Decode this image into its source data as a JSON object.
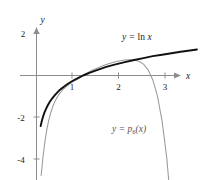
{
  "chart_data": {
    "type": "line",
    "title": "",
    "xlabel": "x",
    "ylabel": "y",
    "xlim": [
      -0.35,
      3.45
    ],
    "ylim": [
      -4.9,
      2.45
    ],
    "grid": false,
    "legend_position": "inline-annotations",
    "xticks": [
      1,
      2,
      3
    ],
    "xtick_labels": [
      "1",
      "2",
      "3"
    ],
    "yticks": [
      2,
      -2,
      -4
    ],
    "ytick_labels": [
      "2",
      "-2",
      "-4"
    ],
    "series": [
      {
        "name": "y = ln x",
        "label_plain": "y = ln x",
        "label_lhs": "y",
        "label_eq": "=",
        "label_fn": "ln",
        "label_arg": "x",
        "color": "#111111",
        "width": 1.9,
        "x": [
          0.09,
          0.1,
          0.12,
          0.14,
          0.17,
          0.2,
          0.24,
          0.28,
          0.33,
          0.4,
          0.48,
          0.56,
          0.66,
          0.78,
          0.9,
          1.0,
          1.15,
          1.3,
          1.5,
          1.7,
          1.9,
          2.1,
          2.3,
          2.5,
          2.7,
          2.9,
          3.1,
          3.3,
          3.45
        ],
        "y": [
          -2.41,
          -2.3,
          -2.12,
          -1.97,
          -1.77,
          -1.61,
          -1.43,
          -1.27,
          -1.11,
          -0.92,
          -0.73,
          -0.58,
          -0.42,
          -0.25,
          -0.11,
          0.0,
          0.14,
          0.26,
          0.41,
          0.53,
          0.64,
          0.74,
          0.83,
          0.92,
          0.99,
          1.06,
          1.13,
          1.19,
          1.24
        ]
      },
      {
        "name": "y = p6(x)",
        "label_plain": "y = p6(x)",
        "label_lhs": "y",
        "label_eq": "=",
        "label_fn": "p",
        "label_sub": "6",
        "label_arg": "(x)",
        "color": "#9a9a9a",
        "width": 1.05,
        "degree": 6,
        "center": 1,
        "x": [
          0.1,
          0.14,
          0.18,
          0.22,
          0.26,
          0.3,
          0.35,
          0.4,
          0.45,
          0.5,
          0.56,
          0.62,
          0.7,
          0.78,
          0.86,
          0.94,
          1.0,
          1.1,
          1.2,
          1.3,
          1.4,
          1.5,
          1.6,
          1.7,
          1.8,
          1.9,
          2.0,
          2.1,
          2.2,
          2.3,
          2.4,
          2.5,
          2.6,
          2.7,
          2.8,
          2.9,
          3.0,
          3.08
        ],
        "y": [
          -4.76,
          -3.88,
          -3.16,
          -2.6,
          -2.16,
          -1.81,
          -1.48,
          -1.22,
          -1.01,
          -0.85,
          -0.69,
          -0.56,
          -0.42,
          -0.3,
          -0.2,
          -0.1,
          0.0,
          0.13,
          0.25,
          0.35,
          0.44,
          0.52,
          0.59,
          0.65,
          0.7,
          0.74,
          0.75,
          0.74,
          0.68,
          0.54,
          0.27,
          -0.2,
          -0.97,
          -2.16,
          -3.9,
          -6.4,
          -9.8,
          -13.2
        ]
      }
    ]
  },
  "labels": {
    "y_axis": "y",
    "x_axis": "x",
    "ln_label": "y = ln x",
    "poly_label": "y = p6(x)"
  }
}
